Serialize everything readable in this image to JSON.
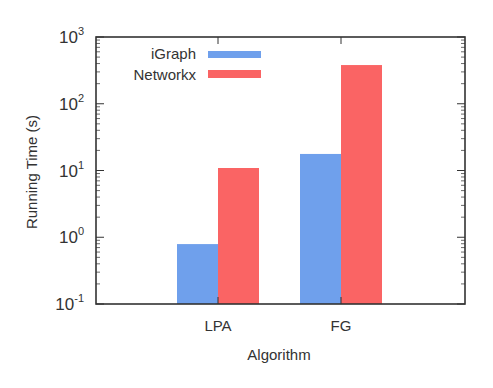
{
  "chart_data": {
    "type": "bar",
    "title": "",
    "xlabel": "Algorithm",
    "ylabel": "Running Time (s)",
    "yscale": "log",
    "ylim": [
      0.1,
      1000
    ],
    "yticks": [
      {
        "base": "10",
        "exp": "-1",
        "value": 0.1
      },
      {
        "base": "10",
        "exp": "0",
        "value": 1
      },
      {
        "base": "10",
        "exp": "1",
        "value": 10
      },
      {
        "base": "10",
        "exp": "2",
        "value": 100
      },
      {
        "base": "10",
        "exp": "3",
        "value": 1000
      }
    ],
    "categories": [
      "LPA",
      "FG"
    ],
    "series": [
      {
        "name": "iGraph",
        "color": "#6fa0ec",
        "values": [
          0.79,
          17.7
        ]
      },
      {
        "name": "Networkx",
        "color": "#fa6464",
        "values": [
          10.9,
          380
        ]
      }
    ],
    "legend_position": "upper left",
    "grid": false
  }
}
